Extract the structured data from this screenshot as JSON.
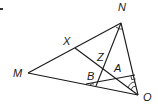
{
  "diagram": {
    "type": "geometry",
    "points": {
      "M": {
        "label": "M",
        "x": 28,
        "y": 73
      },
      "N": {
        "label": "N",
        "x": 121,
        "y": 23
      },
      "O": {
        "label": "O",
        "x": 138,
        "y": 95
      },
      "X": {
        "label": "X",
        "x": 75,
        "y": 48
      },
      "P": {
        "label": "",
        "x": 96,
        "y": 86
      },
      "Q": {
        "label": "",
        "x": 86,
        "y": 84
      },
      "R": {
        "label": "",
        "x": 135,
        "y": 75
      }
    },
    "labels": {
      "N": "N",
      "M": "M",
      "O": "O",
      "X": "X",
      "Z": "Z",
      "B": "B",
      "A": "A"
    },
    "segments": [
      [
        "M",
        "N"
      ],
      [
        "N",
        "O"
      ],
      [
        "M",
        "O"
      ],
      [
        "X",
        "O"
      ],
      [
        "N",
        "P"
      ],
      [
        "Q",
        "R"
      ]
    ],
    "markings": {
      "right_angle_at": "R on NO",
      "angle_arcs_at_N": 1,
      "angle_arcs_at_O": 2,
      "angle_arc_at_P": 1
    },
    "color": "#1a1a1a"
  }
}
